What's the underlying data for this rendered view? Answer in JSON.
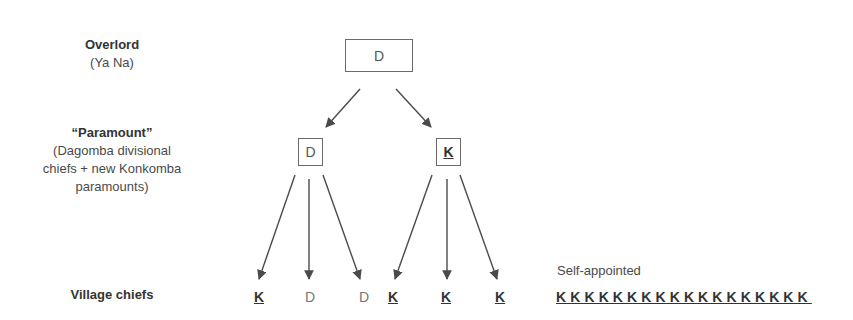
{
  "levels": {
    "overlord": {
      "title": "Overlord",
      "subtitle": "(Ya Na)"
    },
    "paramount": {
      "title": "“Paramount”",
      "lines": [
        "(Dagomba divisional",
        "chiefs + new Konkomba",
        "paramounts)"
      ]
    },
    "village": {
      "title": "Village chiefs"
    }
  },
  "nodes": {
    "top": "D",
    "mid_left": "D",
    "mid_right": "K"
  },
  "village_row": [
    {
      "letter": "K",
      "group": "Konkomba"
    },
    {
      "letter": "D",
      "group": "Dagomba"
    },
    {
      "letter": "D",
      "group": "Dagomba"
    },
    {
      "letter": "K",
      "group": "Konkomba"
    },
    {
      "letter": "K",
      "group": "Konkomba"
    },
    {
      "letter": "K",
      "group": "Konkomba"
    }
  ],
  "self_appointed": {
    "label": "Self-appointed",
    "letters": "KKKKKKKKKKKKKKKKKK",
    "count": 18
  },
  "colors": {
    "line": "#4a4a4a",
    "box_border": "#6a6a6a",
    "k_text": "#333333",
    "d_text": "#777777"
  }
}
